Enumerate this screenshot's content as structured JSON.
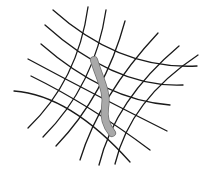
{
  "diagram": {
    "title": "",
    "mesh": {
      "family_a_count": 6,
      "family_b_count": 6,
      "line_color": "#1a1a1a"
    },
    "rod": {
      "fill_color": "#a9a9a9",
      "edge_color": "#6e6e6e"
    },
    "background_color": "#ffffff"
  }
}
